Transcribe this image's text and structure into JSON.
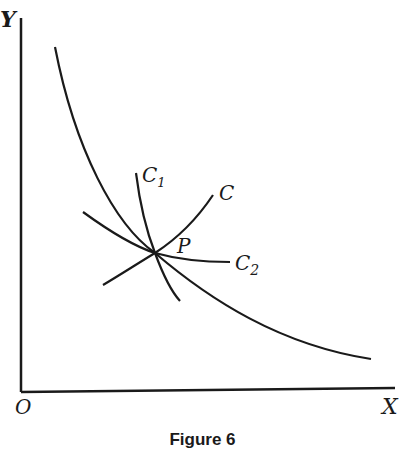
{
  "diagram": {
    "axes": {
      "y_label": "Y",
      "x_label": "X",
      "origin_label": "O"
    },
    "curve_labels": {
      "c": "C",
      "c1": "C",
      "c1_sub": "1",
      "c2": "C",
      "c2_sub": "2",
      "point": "P"
    },
    "caption": "Figure 6",
    "colors": {
      "ink": "#1a1a1a",
      "background": "#ffffff"
    }
  }
}
